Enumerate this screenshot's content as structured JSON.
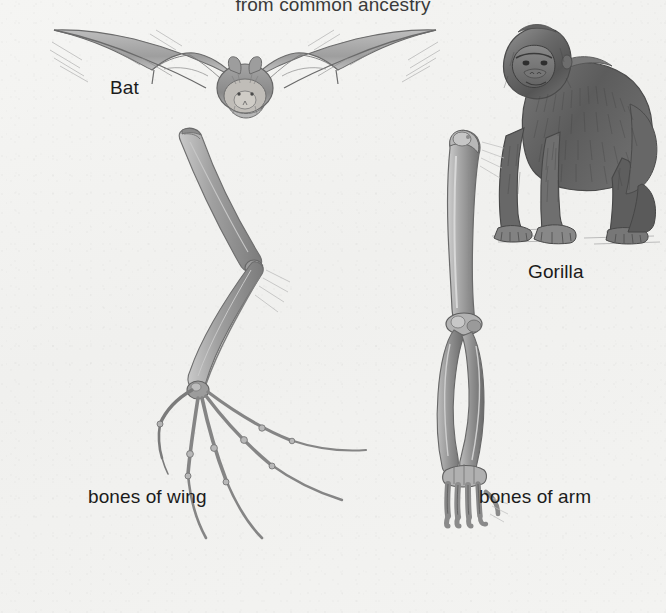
{
  "figure": {
    "title": "from common ancestry",
    "background_color": "#f2f2f0",
    "ink_color": "#6f6f6f",
    "text_color": "#1b1b1b",
    "medium": "pencil drawing"
  },
  "labels": {
    "bat": "Bat",
    "gorilla": "Gorilla",
    "bones_of_wing": "bones of wing",
    "bones_of_arm": "bones of arm"
  },
  "illustrations": [
    {
      "name": "bat-in-flight",
      "subject": "Bat",
      "description": "pencil sketch of a bat in flight with both wings spread wide"
    },
    {
      "name": "gorilla-standing",
      "subject": "Gorilla",
      "description": "pencil sketch of a gorilla standing on all fours in knuckle-walking pose"
    },
    {
      "name": "bat-wing-skeleton",
      "subject": "bones of wing",
      "description": "bat forelimb skeleton: humerus, radius and ulna, carpals, and five greatly elongated digits fanning outward"
    },
    {
      "name": "gorilla-arm-skeleton",
      "subject": "bones of arm",
      "description": "gorilla forelimb skeleton: humerus, elbow joint, radius and ulna, carpals and short digits"
    }
  ]
}
